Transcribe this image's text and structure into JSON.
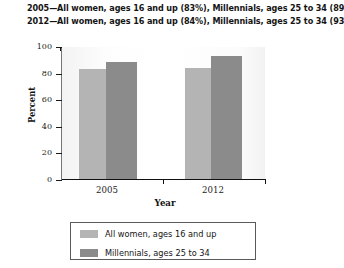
{
  "caption": {
    "lines": [
      "2005—All women, ages 16 and up (83%), Millennials, ages 25 to 34 (89%)",
      "2012—All women, ages 16 and up (84%), Millennials, ages 25 to 34 (93%)"
    ]
  },
  "colors": {
    "series_light": "#b4b4b4",
    "series_dark": "#8b8b8b",
    "axis": "#111111",
    "legend_border": "#5a5a5a"
  },
  "axes": {
    "y_title": "Percent",
    "x_title": "Year",
    "y_ticks": [
      "100",
      "80",
      "60",
      "40",
      "20",
      "0"
    ],
    "x_ticks": [
      "2005",
      "2012"
    ]
  },
  "legend": {
    "entries": [
      {
        "label": "All women, ages 16 and up",
        "swatch": "light"
      },
      {
        "label": "Millennials, ages 25 to 34",
        "swatch": "dark"
      }
    ]
  },
  "chart_data": {
    "type": "bar",
    "title": "",
    "subtitle": "",
    "categories": [
      "2005",
      "2012"
    ],
    "series": [
      {
        "name": "All women, ages 16 and up",
        "values": [
          83,
          84
        ],
        "color": "#b4b4b4"
      },
      {
        "name": "Millennials, ages 25 to 34",
        "values": [
          89,
          93
        ],
        "color": "#8b8b8b"
      }
    ],
    "xlabel": "Year",
    "ylabel": "Percent",
    "ylim": [
      0,
      100
    ],
    "ytick_step": 20,
    "grid": false,
    "legend_position": "bottom",
    "annotations": [
      "2005—All women, ages 16 and up (83%), Millennials, ages 25 to 34 (89%)",
      "2012—All women, ages 16 and up (84%), Millennials, ages 25 to 34 (93%)"
    ]
  }
}
